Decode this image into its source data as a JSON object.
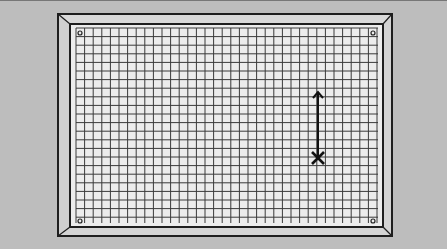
{
  "diagram": {
    "type": "grid-panel",
    "background_color": "#bdbdbd",
    "frame": {
      "outer": {
        "x": 58,
        "y": 14,
        "w": 334,
        "h": 222
      },
      "inner": {
        "x": 70,
        "y": 24,
        "w": 313,
        "h": 203
      },
      "color": "#1e1e1e",
      "bevel_color": "#d6d6d6"
    },
    "grid": {
      "x": 76,
      "y": 28,
      "w": 302,
      "h": 195,
      "cell_size": 8.6,
      "line_color": "#3a3a3a",
      "fill_color": "#ececec"
    },
    "corner_markers": [
      {
        "name": "top-left",
        "x": 80,
        "y": 33
      },
      {
        "name": "top-right",
        "x": 373,
        "y": 33
      },
      {
        "name": "bottom-left",
        "x": 80,
        "y": 221
      },
      {
        "name": "bottom-right",
        "x": 373,
        "y": 221
      }
    ],
    "arrow": {
      "x": 318,
      "y_start": 158,
      "y_end": 92,
      "direction": "up"
    },
    "cross_mark": {
      "x": 318,
      "y": 158,
      "size": 6
    }
  }
}
